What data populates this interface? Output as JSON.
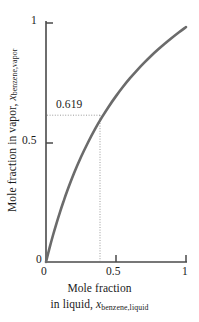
{
  "chart_data": {
    "type": "line",
    "title": "",
    "subtitle": "",
    "xlabel_line1": "Mole fraction",
    "xlabel_line2_prefix": "in liquid, ",
    "xlabel_var": "x",
    "xlabel_sub": "benzene,liquid",
    "ylabel_prefix": "Mole fraction in vapor, ",
    "ylabel_var": "x",
    "ylabel_sub": "benzene,vapor",
    "xlim": [
      0,
      1
    ],
    "ylim": [
      0,
      1
    ],
    "xticks": [
      "0",
      "0.5",
      "1"
    ],
    "xtick_values": [
      0,
      0.5,
      1
    ],
    "yticks": [
      "0",
      "0.5",
      "1"
    ],
    "ytick_values": [
      0,
      0.5,
      1
    ],
    "grid": false,
    "legend": "none",
    "line_color": "#6b6b6b",
    "axis_color": "#4a4a4a",
    "guide_color": "#9a9a9a",
    "series": [
      {
        "name": "benzene vapor-liquid equilibrium",
        "x": [
          0.0,
          0.025,
          0.05,
          0.075,
          0.1,
          0.125,
          0.15,
          0.2,
          0.25,
          0.3,
          0.35,
          0.385,
          0.4,
          0.45,
          0.5,
          0.55,
          0.6,
          0.65,
          0.7,
          0.75,
          0.8,
          0.85,
          0.9,
          0.95,
          1.0
        ],
        "y": [
          0.0,
          0.058,
          0.112,
          0.162,
          0.209,
          0.253,
          0.295,
          0.371,
          0.439,
          0.5,
          0.556,
          0.619,
          0.606,
          0.652,
          0.694,
          0.733,
          0.769,
          0.802,
          0.833,
          0.862,
          0.889,
          0.914,
          0.938,
          0.961,
          0.983
        ]
      }
    ],
    "annotations": [
      {
        "label": "0.619",
        "x": 0.385,
        "y": 0.619,
        "style": "dotted-guide-lines"
      }
    ]
  },
  "axes": {
    "y_tick_1": "1",
    "y_tick_05": "0.5",
    "y_tick_0": "0",
    "x_tick_0": "0",
    "x_tick_05": "0.5",
    "x_tick_1": "1"
  },
  "annotation": {
    "value_label": "0.619"
  }
}
